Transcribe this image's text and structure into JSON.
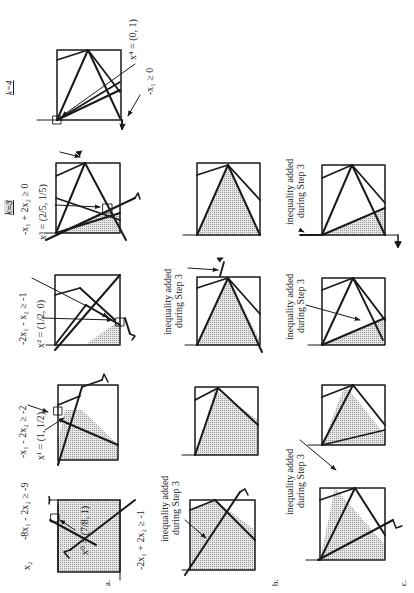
{
  "figure": {
    "orientation": "rotated 90 degrees counter-clockwise",
    "row_labels": [
      "a.",
      "b.",
      "c."
    ],
    "iteration_labels": [
      "k=3",
      "k=4"
    ],
    "axis_label": "x2",
    "fill_pattern_color": "#b8b8b8",
    "line_color": "#1a1a1a"
  },
  "row_a": {
    "label": "a.",
    "k0": {
      "point": "x⁰ = (7/8, 1)",
      "ineq_top": "-8x₁ - 2x₂ ≥ -9",
      "ineq_bottom": "-2x₁ + 2x₂ ≥ -1",
      "axis": "x₂"
    },
    "k1": {
      "point": "x¹ = (1, 1/2)",
      "ineq": "-x₁ - 2x₂ ≥ -2"
    },
    "k2": {
      "point": "x² = (1/2, 0)",
      "ineq": "-2x₁ - x₂ ≥ -1"
    },
    "k3": {
      "k_label": "k=3",
      "point": "x³ = (2/5, 1/5)",
      "ineq": "-x₁ + 2x₂ ≥ 0"
    },
    "k4": {
      "k_label": "k=4",
      "point": "x⁴ = (0, 1)",
      "ineq": "-x₁ ≥ 0"
    }
  },
  "row_b": {
    "label": "b.",
    "k0_note_line1": "inequality added",
    "k0_note_line2": "during Step 3",
    "k2_note_line1": "inequality added",
    "k2_note_line2": "during Step 3"
  },
  "row_c": {
    "label": "c.",
    "k1_note_line1": "inequality added",
    "k1_note_line2": "during Step 3",
    "k2_note_line1": "inequality added",
    "k2_note_line2": "during Step 3",
    "k3_note_line1": "inequality added",
    "k3_note_line2": "during Step 3"
  }
}
